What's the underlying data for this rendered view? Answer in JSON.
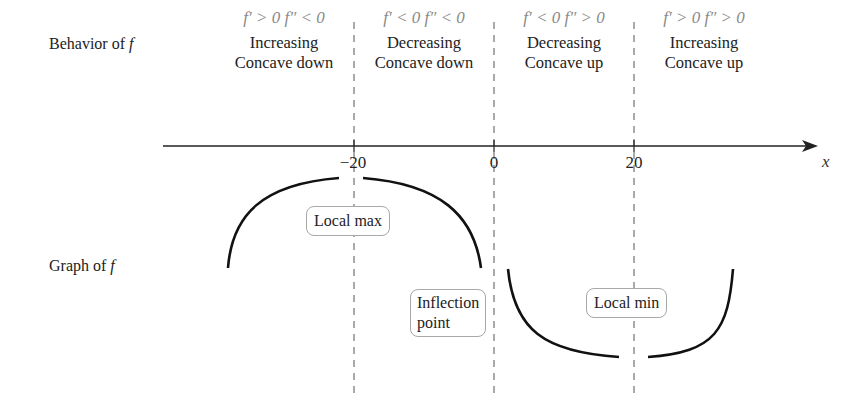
{
  "rows": {
    "behavior_label": "Behavior of ",
    "behavior_var": "f",
    "graph_label": "Graph of ",
    "graph_var": "f"
  },
  "intervals": [
    {
      "condition": "f′ > 0 f″ < 0",
      "line1": "Increasing",
      "line2": "Concave down"
    },
    {
      "condition": "f′ < 0 f″ < 0",
      "line1": "Decreasing",
      "line2": "Concave down"
    },
    {
      "condition": "f′ < 0 f″ > 0",
      "line1": "Decreasing",
      "line2": "Concave up"
    },
    {
      "condition": "f′ > 0 f″ > 0",
      "line1": "Increasing",
      "line2": "Concave up"
    }
  ],
  "axis": {
    "label": "x",
    "ticks": [
      "−20",
      "0",
      "20"
    ]
  },
  "callouts": {
    "local_max": "Local max",
    "inflection_line1": "Inflection",
    "inflection_line2": "point",
    "local_min": "Local min"
  },
  "colors": {
    "curve": "#111111",
    "dashed": "#555555",
    "condition_text": "#8a8a8a",
    "callout_border": "#a8a8a8"
  }
}
